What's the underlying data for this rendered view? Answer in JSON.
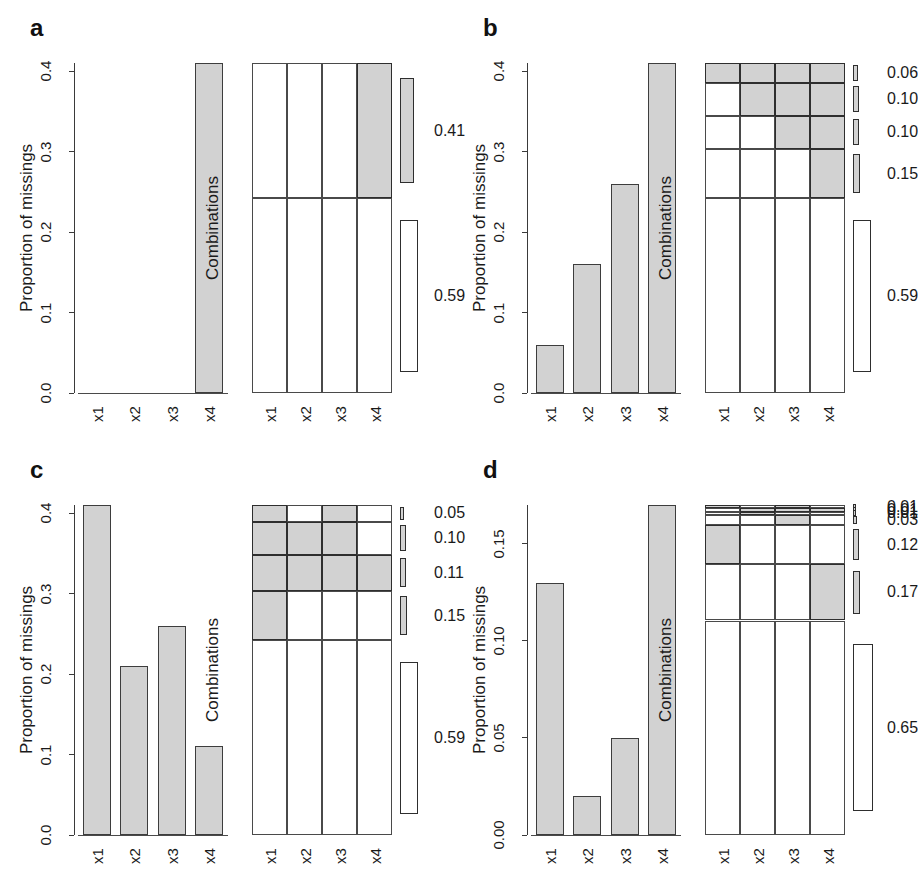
{
  "figure": {
    "width": 906,
    "height": 884,
    "background": "#ffffff",
    "fill_color": "#d2d2d2",
    "line_color": "#3a3a3a",
    "empty_color": "#ffffff"
  },
  "axis_labels": {
    "y_proportion": "Proportion of missings",
    "y_combinations": "Combinations"
  },
  "panels": [
    {
      "label": "a",
      "chart_data": {
        "type": "bar",
        "title": "",
        "xlabel": "",
        "ylabel": "Proportion of missings",
        "categories": [
          "x1",
          "x2",
          "x3",
          "x4"
        ],
        "values": [
          0.0,
          0.0,
          0.0,
          0.41
        ],
        "ylim": [
          0.0,
          0.41
        ],
        "yticks": [
          0.0,
          0.1,
          0.2,
          0.3,
          0.4
        ],
        "yticklabels": [
          "0.0",
          "0.1",
          "0.2",
          "0.3",
          "0.4"
        ],
        "grid": false,
        "legend": "none"
      },
      "combinations": {
        "type": "heatmap",
        "ylabel": "Combinations",
        "columns": [
          "x1",
          "x2",
          "x3",
          "x4"
        ],
        "rows": [
          {
            "pattern": [
              0,
              0,
              0,
              1
            ],
            "proportion": 0.41,
            "label": "0.41"
          },
          {
            "pattern": [
              0,
              0,
              0,
              0
            ],
            "proportion": 0.59,
            "label": "0.59"
          }
        ]
      }
    },
    {
      "label": "b",
      "chart_data": {
        "type": "bar",
        "title": "",
        "xlabel": "",
        "ylabel": "Proportion of missings",
        "categories": [
          "x1",
          "x2",
          "x3",
          "x4"
        ],
        "values": [
          0.06,
          0.16,
          0.26,
          0.41
        ],
        "ylim": [
          0.0,
          0.41
        ],
        "yticks": [
          0.0,
          0.1,
          0.2,
          0.3,
          0.4
        ],
        "yticklabels": [
          "0.0",
          "0.1",
          "0.2",
          "0.3",
          "0.4"
        ],
        "grid": false,
        "legend": "none"
      },
      "combinations": {
        "type": "heatmap",
        "ylabel": "Combinations",
        "columns": [
          "x1",
          "x2",
          "x3",
          "x4"
        ],
        "rows": [
          {
            "pattern": [
              1,
              1,
              1,
              1
            ],
            "proportion": 0.06,
            "label": "0.06"
          },
          {
            "pattern": [
              0,
              1,
              1,
              1
            ],
            "proportion": 0.1,
            "label": "0.10"
          },
          {
            "pattern": [
              0,
              0,
              1,
              1
            ],
            "proportion": 0.1,
            "label": "0.10"
          },
          {
            "pattern": [
              0,
              0,
              0,
              1
            ],
            "proportion": 0.15,
            "label": "0.15"
          },
          {
            "pattern": [
              0,
              0,
              0,
              0
            ],
            "proportion": 0.59,
            "label": "0.59"
          }
        ]
      }
    },
    {
      "label": "c",
      "chart_data": {
        "type": "bar",
        "title": "",
        "xlabel": "",
        "ylabel": "Proportion of missings",
        "categories": [
          "x1",
          "x2",
          "x3",
          "x4"
        ],
        "values": [
          0.41,
          0.21,
          0.26,
          0.11
        ],
        "ylim": [
          0.0,
          0.41
        ],
        "yticks": [
          0.0,
          0.1,
          0.2,
          0.3,
          0.4
        ],
        "yticklabels": [
          "0.0",
          "0.1",
          "0.2",
          "0.3",
          "0.4"
        ],
        "grid": false,
        "legend": "none"
      },
      "combinations": {
        "type": "heatmap",
        "ylabel": "Combinations",
        "columns": [
          "x1",
          "x2",
          "x3",
          "x4"
        ],
        "rows": [
          {
            "pattern": [
              1,
              0,
              1,
              0
            ],
            "proportion": 0.05,
            "label": "0.05"
          },
          {
            "pattern": [
              1,
              1,
              1,
              0
            ],
            "proportion": 0.1,
            "label": "0.10"
          },
          {
            "pattern": [
              1,
              1,
              1,
              1
            ],
            "proportion": 0.11,
            "label": "0.11"
          },
          {
            "pattern": [
              1,
              0,
              0,
              0
            ],
            "proportion": 0.15,
            "label": "0.15"
          },
          {
            "pattern": [
              0,
              0,
              0,
              0
            ],
            "proportion": 0.59,
            "label": "0.59"
          }
        ]
      }
    },
    {
      "label": "d",
      "chart_data": {
        "type": "bar",
        "title": "",
        "xlabel": "",
        "ylabel": "Proportion of missings",
        "categories": [
          "x1",
          "x2",
          "x3",
          "x4"
        ],
        "values": [
          0.13,
          0.02,
          0.05,
          0.17
        ],
        "ylim": [
          0.0,
          0.17
        ],
        "yticks": [
          0.0,
          0.05,
          0.1,
          0.15
        ],
        "yticklabels": [
          "0.00",
          "0.05",
          "0.10",
          "0.15"
        ],
        "grid": false,
        "legend": "none"
      },
      "combinations": {
        "type": "heatmap",
        "ylabel": "Combinations",
        "columns": [
          "x1",
          "x2",
          "x3",
          "x4"
        ],
        "rows": [
          {
            "pattern": [
              1,
              0,
              1,
              0
            ],
            "proportion": 0.01,
            "label": "0.01"
          },
          {
            "pattern": [
              0,
              1,
              1,
              1
            ],
            "proportion": 0.01,
            "label": "0.01"
          },
          {
            "pattern": [
              0,
              1,
              0,
              0
            ],
            "proportion": 0.01,
            "label": "0.01"
          },
          {
            "pattern": [
              0,
              0,
              1,
              0
            ],
            "proportion": 0.03,
            "label": "0.03"
          },
          {
            "pattern": [
              1,
              0,
              0,
              0
            ],
            "proportion": 0.12,
            "label": "0.12"
          },
          {
            "pattern": [
              0,
              0,
              0,
              1
            ],
            "proportion": 0.17,
            "label": "0.17"
          },
          {
            "pattern": [
              0,
              0,
              0,
              0
            ],
            "proportion": 0.65,
            "label": "0.65"
          }
        ]
      }
    }
  ]
}
